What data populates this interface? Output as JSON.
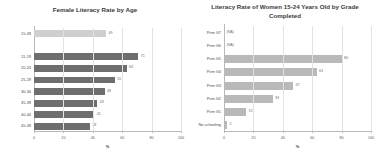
{
  "chart_data": [
    {
      "type": "bar",
      "orientation": "horizontal",
      "title": "Female Literacy Rate by Age",
      "xlabel": "%",
      "ylabel": "",
      "xlim": [
        0,
        100
      ],
      "xticks": [
        0,
        20,
        40,
        60,
        80,
        100
      ],
      "xticklabels": [
        "0",
        "20",
        "40",
        "60",
        "80",
        "100"
      ],
      "grid": true,
      "legend": "none",
      "categories": [
        "15-49",
        "15-19",
        "20-24",
        "25-29",
        "30-34",
        "35-39",
        "40-44",
        "45-49"
      ],
      "values": [
        49,
        71,
        63,
        55,
        48,
        43,
        41,
        38
      ],
      "value_labels": [
        "49",
        "71",
        "63",
        "55",
        "48",
        "43",
        "41",
        "38"
      ],
      "bar_colors": [
        "#cfcfcf",
        "#6e6e6e",
        "#6e6e6e",
        "#6e6e6e",
        "#6e6e6e",
        "#6e6e6e",
        "#6e6e6e",
        "#6e6e6e"
      ],
      "accent_index": 0,
      "gap_after_index": 0
    },
    {
      "type": "bar",
      "orientation": "horizontal",
      "title": "Literacy Rate of Women 15-24 Years Old by Grade Completed",
      "xlabel": "%",
      "ylabel": "",
      "xlim": [
        0,
        100
      ],
      "xticks": [
        0,
        20,
        40,
        60,
        80,
        100
      ],
      "xticklabels": [
        "0",
        "20",
        "40",
        "60",
        "80",
        "100"
      ],
      "grid": true,
      "legend": "none",
      "categories": [
        "Prim G7",
        "Prim G6",
        "Prim G5",
        "Prim G4",
        "Prim G3",
        "Prim G2",
        "Prim G1",
        "No schooling"
      ],
      "values": [
        null,
        null,
        80,
        63,
        47,
        33,
        15,
        2
      ],
      "value_labels": [
        "(NA)",
        "(NA)",
        "80",
        "63",
        "47",
        "33",
        "15",
        "2"
      ],
      "bar_colors": [
        "none",
        "none",
        "#b9b9b9",
        "#b9b9b9",
        "#b9b9b9",
        "#b9b9b9",
        "#b9b9b9",
        "#b9b9b9"
      ]
    }
  ],
  "left": {
    "title": "Female Literacy Rate by Age",
    "axis_title": "%",
    "rows": [
      {
        "label": "15-49",
        "value_label": "49"
      },
      {
        "label": "15-19",
        "value_label": "71"
      },
      {
        "label": "20-24",
        "value_label": "63"
      },
      {
        "label": "25-29",
        "value_label": "55"
      },
      {
        "label": "30-34",
        "value_label": "48"
      },
      {
        "label": "35-39",
        "value_label": "43"
      },
      {
        "label": "40-44",
        "value_label": "41"
      },
      {
        "label": "45-49",
        "value_label": "38"
      }
    ],
    "ticks": [
      {
        "label": "0"
      },
      {
        "label": "20"
      },
      {
        "label": "40"
      },
      {
        "label": "60"
      },
      {
        "label": "80"
      },
      {
        "label": "100"
      }
    ]
  },
  "right": {
    "title": "Literacy Rate of Women 15-24 Years Old by Grade Completed",
    "axis_title": "%",
    "rows": [
      {
        "label": "Prim G7",
        "value_label": "(NA)"
      },
      {
        "label": "Prim G6",
        "value_label": "(NA)"
      },
      {
        "label": "Prim G5",
        "value_label": "80"
      },
      {
        "label": "Prim G4",
        "value_label": "63"
      },
      {
        "label": "Prim G3",
        "value_label": "47"
      },
      {
        "label": "Prim G2",
        "value_label": "33"
      },
      {
        "label": "Prim G1",
        "value_label": "15"
      },
      {
        "label": "No schooling",
        "value_label": "2"
      }
    ],
    "ticks": [
      {
        "label": "0"
      },
      {
        "label": "20"
      },
      {
        "label": "40"
      },
      {
        "label": "60"
      },
      {
        "label": "80"
      },
      {
        "label": "100"
      }
    ]
  }
}
